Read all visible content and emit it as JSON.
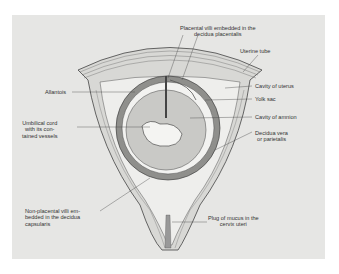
{
  "diagram": {
    "colors": {
      "panel": "#e6e6e4",
      "ink": "#333333",
      "amnion_fill": "#c9c9c6"
    },
    "labels": {
      "placental_villi": "Placental villi embedded in the\ndecidua placentalis",
      "uterine_tube": "Uterine tube",
      "allantois": "Allantois",
      "cavity_of_uterus": "Cavity of uterus",
      "yolk_sac": "Yolk sac",
      "umbilical_cord": "Umbilical cord\nwith its con-\ntained vessels",
      "cavity_of_amnion": "Cavity of amnion",
      "decidua_vera": "Decidua vera\nor parietalis",
      "non_placental_villi": "Non-placental villi em-\nbedded in the decidua\ncapsularis",
      "plug_of_mucus": "Plug of mucus in the\ncervix uteri"
    }
  }
}
